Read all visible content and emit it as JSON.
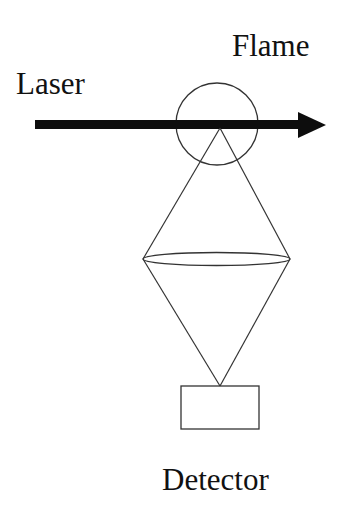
{
  "labels": {
    "laser": "Laser",
    "flame": "Flame",
    "detector": "Detector"
  },
  "colors": {
    "stroke": "#333333",
    "arrow": "#0d0d0d",
    "background": "#ffffff"
  }
}
